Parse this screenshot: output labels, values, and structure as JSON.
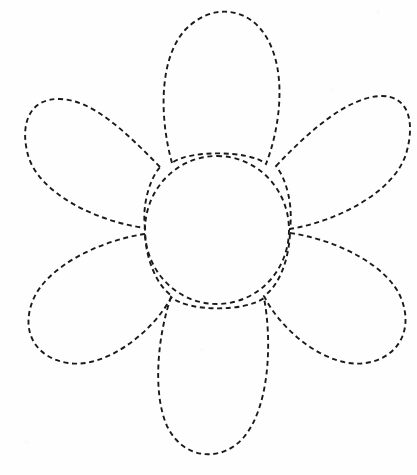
{
  "document": {
    "title": "Flower Tracing Template",
    "type": "line-art-worksheet",
    "background_color": "#fefefe",
    "stroke_color": "#1a1a1a",
    "stroke_width": 1.9,
    "dash_pattern": "5 3.6",
    "canvas": {
      "width": 417,
      "height": 475
    }
  },
  "flower": {
    "name": "six-petal-daisy-outline",
    "petal_count": 6,
    "center": {
      "name": "flower-center",
      "label": "Center disc",
      "cx": 217,
      "cy": 230,
      "rx": 72,
      "ry": 74,
      "path": "M 217 156 C 257 156 289 189 289 230 C 289 271 257 304 217 304 C 177 304 145 271 145 230 C 145 189 177 156 217 156 Z"
    },
    "petals": [
      {
        "name": "petal-top",
        "label": "Top petal",
        "tip": {
          "x": 217,
          "y": 12
        },
        "angle_deg": 0,
        "path": "M 172 163 C 160 120 158 60 185 30 C 212 2 248 8 265 35 C 288 70 280 128 266 164 C 250 150 188 150 172 163 Z"
      },
      {
        "name": "petal-upper-left",
        "label": "Upper-left petal",
        "tip": {
          "x": 22,
          "y": 118
        },
        "angle_deg": -55,
        "path": "M 160 167 C 124 130 92 100 60 99 C 28 98 20 126 28 155 C 38 192 94 221 145 228 C 142 206 149 180 160 167 Z"
      },
      {
        "name": "petal-upper-right",
        "label": "Upper-right petal",
        "tip": {
          "x": 412,
          "y": 120
        },
        "angle_deg": 55,
        "path": "M 276 166 C 312 128 348 98 380 96 C 410 95 415 124 406 154 C 394 192 338 221 290 229 C 293 206 287 180 276 166 Z"
      },
      {
        "name": "petal-lower-left",
        "label": "Lower-left petal",
        "tip": {
          "x": 25,
          "y": 305
        },
        "angle_deg": -125,
        "path": "M 145 234 C 97 241 46 268 33 300 C 20 332 36 358 68 363 C 104 369 152 334 172 296 C 156 285 146 258 145 234 Z"
      },
      {
        "name": "petal-lower-right",
        "label": "Lower-right petal",
        "tip": {
          "x": 406,
          "y": 305
        },
        "angle_deg": 125,
        "path": "M 290 233 C 338 240 388 266 401 298 C 414 330 398 358 366 363 C 330 369 283 334 264 296 C 280 285 289 258 290 233 Z"
      },
      {
        "name": "petal-bottom",
        "label": "Bottom petal",
        "tip": {
          "x": 217,
          "y": 457
        },
        "angle_deg": 180,
        "path": "M 171 297 C 158 335 152 392 167 426 C 183 460 222 463 244 437 C 270 406 272 340 264 298 C 245 312 188 312 171 297 Z"
      }
    ]
  }
}
